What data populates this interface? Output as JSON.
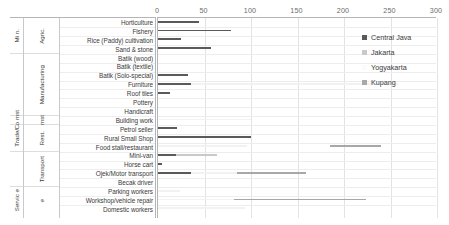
{
  "chart_data": {
    "type": "bar",
    "orientation": "horizontal",
    "title": "",
    "xlabel": "",
    "ylabel": "",
    "xlim": [
      0,
      300
    ],
    "xticks": [
      0,
      50,
      100,
      150,
      200,
      250,
      300
    ],
    "grid": true,
    "legend_position": "top-right",
    "categories": [
      "Horticulture",
      "Fishery",
      "Rice (Paddy) cultivation",
      "Sand & stone",
      "Batik (wood)",
      "Batik (textile)",
      "Batik (Solo-special)",
      "Furniture",
      "Roof tiles",
      "Pottery",
      "Handicraft",
      "Building work",
      "Petrol seller",
      "Rural Small Shop",
      "Food stall/restaurant",
      "Mini-van",
      "Horse cart",
      "Ojek/Motor transport",
      "Becak driver",
      "Parking workers",
      "Workshop/vehicle repair",
      "Domestic workers"
    ],
    "series": [
      {
        "name": "Central Java",
        "color": "#5a5a5a",
        "values": [
          44,
          77,
          25,
          57,
          0,
          0,
          32,
          30,
          15,
          0,
          0,
          0,
          20,
          58,
          18,
          3,
          45,
          45,
          0,
          0,
          0,
          0
        ]
      },
      {
        "name": "Jakarta",
        "color": "#c9c9c9",
        "values": [
          0,
          0,
          0,
          0,
          0,
          0,
          0,
          0,
          0,
          0,
          0,
          0,
          0,
          0,
          0,
          0,
          0,
          0,
          0,
          0,
          0,
          0
        ]
      },
      {
        "name": "Yogyakarta",
        "color": "#f2f2f2",
        "values": [
          0,
          0,
          0,
          0,
          0,
          0,
          0,
          258,
          0,
          0,
          0,
          100,
          0,
          0,
          90,
          0,
          0,
          0,
          0,
          0,
          0,
          0
        ]
      },
      {
        "name": "Kupang",
        "color": "#a8a8a8",
        "values": [
          0,
          0,
          0,
          0,
          0,
          0,
          0,
          0,
          0,
          0,
          0,
          0,
          0,
          0,
          0,
          0,
          0,
          0,
          0,
          0,
          0,
          0
        ]
      }
    ],
    "bars": [
      {
        "row": 0,
        "series": "Central Java",
        "start": 0,
        "value": 44
      },
      {
        "row": 1,
        "series": "Central Java",
        "start": 0,
        "value": 79
      },
      {
        "row": 2,
        "series": "Central Java",
        "start": 0,
        "value": 25
      },
      {
        "row": 3,
        "series": "Central Java",
        "start": 0,
        "value": 57
      },
      {
        "row": 6,
        "series": "Central Java",
        "start": 0,
        "value": 32
      },
      {
        "row": 7,
        "series": "Central Java",
        "start": 0,
        "value": 36
      },
      {
        "row": 7,
        "series": "Yogyakarta",
        "start": 36,
        "value": 222
      },
      {
        "row": 8,
        "series": "Central Java",
        "start": 0,
        "value": 13
      },
      {
        "row": 11,
        "series": "Yogyakarta",
        "start": 0,
        "value": 100
      },
      {
        "row": 12,
        "series": "Central Java",
        "start": 0,
        "value": 20
      },
      {
        "row": 13,
        "series": "Central Java",
        "start": 0,
        "value": 100
      },
      {
        "row": 14,
        "series": "Yogyakarta",
        "start": 0,
        "value": 96
      },
      {
        "row": 14,
        "series": "Kupang",
        "start": 185,
        "value": 55
      },
      {
        "row": 15,
        "series": "Jakarta",
        "start": 19,
        "value": 44
      },
      {
        "row": 15,
        "series": "Central Java",
        "start": 0,
        "value": 19
      },
      {
        "row": 16,
        "series": "Central Java",
        "start": 0,
        "value": 4
      },
      {
        "row": 17,
        "series": "Central Java",
        "start": 0,
        "value": 36
      },
      {
        "row": 17,
        "series": "Yogyakarta",
        "start": 36,
        "value": 49
      },
      {
        "row": 17,
        "series": "Kupang",
        "start": 85,
        "value": 74
      },
      {
        "row": 19,
        "series": "Yogyakarta",
        "start": 0,
        "value": 24
      },
      {
        "row": 20,
        "series": "Yogyakarta",
        "start": 0,
        "value": 82
      },
      {
        "row": 20,
        "series": "Kupang",
        "start": 82,
        "value": 142
      },
      {
        "row": 21,
        "series": "Yogyakarta",
        "start": 0,
        "value": 94
      }
    ],
    "groups": [
      {
        "label": "Agric.",
        "outer": "Mi n.",
        "start": 0,
        "count": 3
      },
      {
        "label": "Min.",
        "outer": "",
        "start": 3,
        "count": 1
      },
      {
        "label": "Manufacturing",
        "outer": "",
        "start": 4,
        "count": 7
      },
      {
        "label": "Co mst",
        "outer": "",
        "start": 11,
        "count": 1
      },
      {
        "label": "Trade/ Rest.",
        "outer": "",
        "start": 12,
        "count": 3
      },
      {
        "label": "Transport",
        "outer": "",
        "start": 15,
        "count": 4
      },
      {
        "label": "Servic e",
        "outer": "",
        "start": 19,
        "count": 3
      }
    ],
    "group_column_outer": [
      {
        "label": "Mi n.",
        "start": 0,
        "count": 4
      },
      {
        "label": "",
        "start": 4,
        "count": 7
      },
      {
        "label": "Co mst",
        "start": 11,
        "count": 1
      },
      {
        "label": "Trade/",
        "start": 12,
        "count": 3
      },
      {
        "label": "",
        "start": 15,
        "count": 4
      },
      {
        "label": "Servic e",
        "start": 19,
        "count": 3
      }
    ],
    "group_column_inner": [
      {
        "label": "Agric.",
        "start": 0,
        "count": 4
      },
      {
        "label": "Manufacturing",
        "start": 4,
        "count": 7
      },
      {
        "label": "mst",
        "start": 11,
        "count": 1
      },
      {
        "label": "Rest.",
        "start": 12,
        "count": 3
      },
      {
        "label": "Transport",
        "start": 15,
        "count": 4
      },
      {
        "label": "e",
        "start": 19,
        "count": 3
      }
    ]
  },
  "legend": {
    "items": [
      {
        "label": "Central Java",
        "color": "#5a5a5a"
      },
      {
        "label": "Jakarta",
        "color": "#c9c9c9"
      },
      {
        "label": "Yogyakarta",
        "color": "#fbfbfb"
      },
      {
        "label": "Kupang",
        "color": "#a8a8a8"
      }
    ]
  },
  "axis": {
    "ticks": [
      "0",
      "50",
      "100",
      "150",
      "200",
      "250",
      "300"
    ]
  }
}
